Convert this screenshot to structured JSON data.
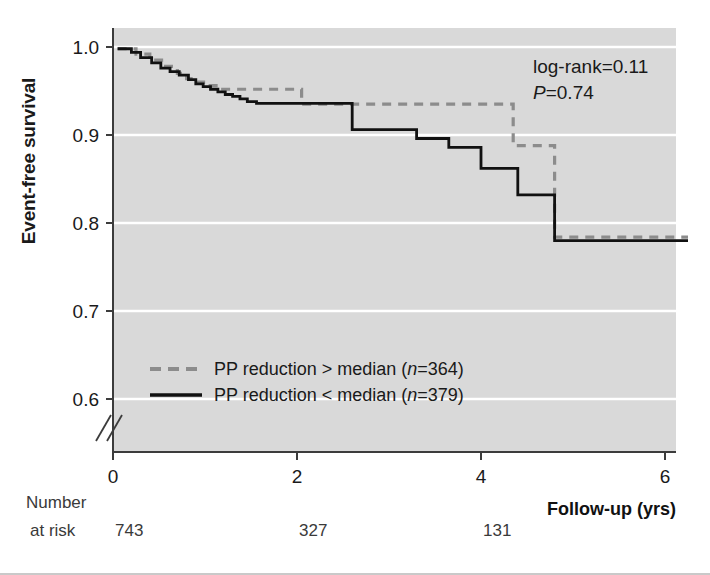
{
  "figure": {
    "plot_bg": "#d9d9d9",
    "grid_color": "#ffffff",
    "axis_color": "#3c3c3c",
    "series_solid_color": "#111111",
    "series_dashed_color": "#8c8c8c"
  },
  "axes": {
    "y_title": "Event-free survival",
    "x_title": "Follow-up (yrs)",
    "y_ticks": [
      "1.0",
      "0.9",
      "0.8",
      "0.7",
      "0.6"
    ],
    "y_tick_values": [
      1.0,
      0.9,
      0.8,
      0.7,
      0.6
    ],
    "x_ticks": [
      "0",
      "2",
      "4",
      "6"
    ],
    "x_tick_values": [
      0,
      2,
      4,
      6
    ],
    "y_axis_break": true
  },
  "annotations": {
    "logrank_label": "log-rank=0.11",
    "p_italic": "P",
    "p_value": "=0.74"
  },
  "legend": {
    "items": [
      {
        "style": "dashed",
        "text_before": "PP reduction > median (",
        "italic": "n",
        "text_after": "=364)"
      },
      {
        "style": "solid",
        "text_before": "PP reduction < median (",
        "italic": "n",
        "text_after": "=379)"
      }
    ]
  },
  "risk_table": {
    "label_line1": "Number",
    "label_line2": "at risk",
    "values": [
      "743",
      "327",
      "131"
    ],
    "at_x": [
      0,
      2,
      4
    ]
  },
  "chart_data": {
    "type": "line",
    "title": "",
    "xlabel": "Follow-up (yrs)",
    "ylabel": "Event-free survival",
    "xlim": [
      0,
      6.3
    ],
    "ylim": [
      0.6,
      1.02
    ],
    "grid": true,
    "legend_position": "bottom-left",
    "step": "post",
    "series": [
      {
        "name": "PP reduction > median (n=364)",
        "style": "dashed",
        "color": "#8c8c8c",
        "x": [
          0.05,
          0.25,
          0.4,
          0.55,
          0.7,
          0.8,
          0.92,
          1.02,
          1.12,
          1.25,
          1.45,
          1.7,
          2.0,
          2.05,
          2.25,
          2.5,
          2.7,
          2.95,
          3.2,
          3.45,
          3.7,
          4.3,
          4.35,
          4.7,
          4.8,
          6.25
        ],
        "y": [
          0.998,
          0.992,
          0.985,
          0.978,
          0.97,
          0.964,
          0.96,
          0.956,
          0.952,
          0.952,
          0.952,
          0.952,
          0.952,
          0.935,
          0.935,
          0.935,
          0.935,
          0.935,
          0.935,
          0.935,
          0.935,
          0.935,
          0.888,
          0.888,
          0.784,
          0.784
        ]
      },
      {
        "name": "PP reduction < median (n=379)",
        "style": "solid",
        "color": "#111111",
        "x": [
          0.05,
          0.2,
          0.3,
          0.42,
          0.52,
          0.62,
          0.72,
          0.82,
          0.9,
          0.98,
          1.06,
          1.14,
          1.22,
          1.3,
          1.38,
          1.46,
          1.56,
          1.66,
          1.76,
          1.86,
          1.96,
          2.1,
          2.55,
          2.6,
          3.25,
          3.3,
          3.6,
          3.65,
          3.95,
          4.0,
          4.35,
          4.4,
          4.75,
          4.8,
          6.25
        ],
        "y": [
          0.998,
          0.994,
          0.988,
          0.982,
          0.976,
          0.972,
          0.968,
          0.963,
          0.958,
          0.955,
          0.952,
          0.949,
          0.946,
          0.944,
          0.941,
          0.938,
          0.936,
          0.936,
          0.936,
          0.936,
          0.936,
          0.936,
          0.936,
          0.906,
          0.906,
          0.896,
          0.896,
          0.886,
          0.886,
          0.862,
          0.862,
          0.832,
          0.832,
          0.78,
          0.78
        ]
      }
    ]
  }
}
